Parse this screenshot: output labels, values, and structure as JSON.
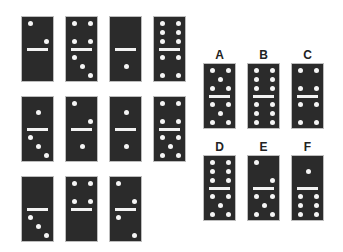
{
  "puzzle": {
    "sequence": [
      {
        "row": 1,
        "col": 1,
        "top": 2,
        "bottom": 0
      },
      {
        "row": 1,
        "col": 2,
        "top": 4,
        "bottom": 3
      },
      {
        "row": 1,
        "col": 3,
        "top": 0,
        "bottom": 1
      },
      {
        "row": 1,
        "col": 4,
        "top": 6,
        "bottom": 4
      },
      {
        "row": 2,
        "col": 1,
        "top": 1,
        "bottom": 3
      },
      {
        "row": 2,
        "col": 2,
        "top": 2,
        "bottom": 1
      },
      {
        "row": 2,
        "col": 3,
        "top": 1,
        "bottom": 1
      },
      {
        "row": 2,
        "col": 4,
        "top": 4,
        "bottom": 5
      },
      {
        "row": 3,
        "col": 1,
        "top": 0,
        "bottom": 3
      },
      {
        "row": 3,
        "col": 2,
        "top": 4,
        "bottom": 0
      },
      {
        "row": 3,
        "col": 3,
        "top": 2,
        "bottom": 2
      }
    ],
    "options": [
      {
        "label": "A",
        "top": 5,
        "bottom": 5
      },
      {
        "label": "B",
        "top": 6,
        "bottom": 6
      },
      {
        "label": "C",
        "top": 4,
        "bottom": 4
      },
      {
        "label": "D",
        "top": 6,
        "bottom": 5
      },
      {
        "label": "E",
        "top": 2,
        "bottom": 5
      },
      {
        "label": "F",
        "top": 1,
        "bottom": 6
      }
    ]
  },
  "colors": {
    "domino": "#2b2b2b",
    "pip": "#f5f5f5",
    "label": "#222222"
  }
}
